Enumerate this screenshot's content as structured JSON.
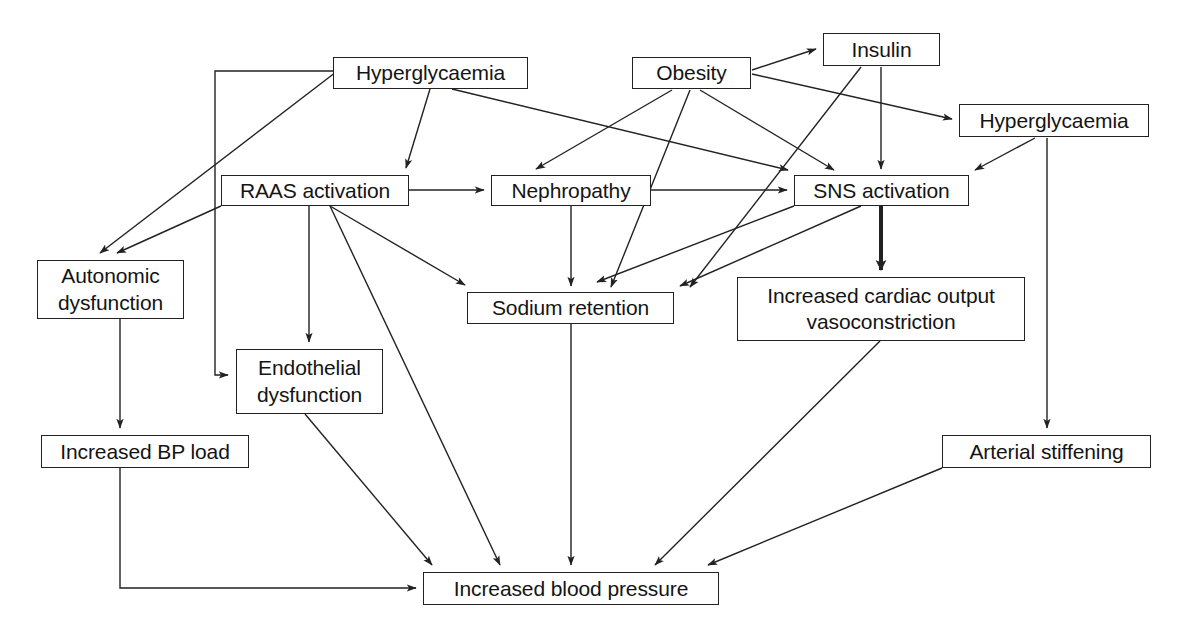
{
  "diagram": {
    "type": "flowchart",
    "canvas": {
      "width": 1188,
      "height": 633
    },
    "style": {
      "box_border_color": "#222222",
      "box_fill_color": "#ffffff",
      "edge_color": "#222222",
      "text_color": "#141414",
      "background": "#ffffff"
    },
    "nodes": [
      {
        "id": "hyperglycaemia_left",
        "label": "Hyperglycaemia",
        "x": 333,
        "y": 57,
        "w": 195,
        "h": 32
      },
      {
        "id": "obesity",
        "label": "Obesity",
        "x": 632,
        "y": 57,
        "w": 119,
        "h": 32
      },
      {
        "id": "insulin",
        "label": "Insulin",
        "x": 823,
        "y": 33,
        "w": 117,
        "h": 33
      },
      {
        "id": "hyperglycaemia_right",
        "label": "Hyperglycaemia",
        "x": 959,
        "y": 104,
        "w": 190,
        "h": 33
      },
      {
        "id": "raas_activation",
        "label": "RAAS activation",
        "x": 221,
        "y": 175,
        "w": 188,
        "h": 31
      },
      {
        "id": "nephropathy",
        "label": "Nephropathy",
        "x": 491,
        "y": 175,
        "w": 160,
        "h": 31
      },
      {
        "id": "sns_activation",
        "label": "SNS activation",
        "x": 794,
        "y": 175,
        "w": 175,
        "h": 31
      },
      {
        "id": "autonomic_dysfunction",
        "label": "Autonomic\ndysfunction",
        "x": 37,
        "y": 260,
        "w": 147,
        "h": 59
      },
      {
        "id": "sodium_retention",
        "label": "Sodium retention",
        "x": 467,
        "y": 292,
        "w": 207,
        "h": 32
      },
      {
        "id": "increased_cardiac_output",
        "label": "Increased cardiac output\nvasoconstriction",
        "x": 737,
        "y": 277,
        "w": 288,
        "h": 64
      },
      {
        "id": "endothelial_dysfunction",
        "label": "Endothelial\ndysfunction",
        "x": 236,
        "y": 349,
        "w": 147,
        "h": 65
      },
      {
        "id": "increased_bp_load",
        "label": "Increased BP load",
        "x": 41,
        "y": 435,
        "w": 208,
        "h": 33
      },
      {
        "id": "arterial_stiffening",
        "label": "Arterial stiffening",
        "x": 942,
        "y": 435,
        "w": 209,
        "h": 33
      },
      {
        "id": "increased_blood_pressure",
        "label": "Increased blood pressure",
        "x": 423,
        "y": 572,
        "w": 296,
        "h": 33
      }
    ],
    "edges": [
      {
        "from": "hyperglycaemia_left",
        "to": "raas_activation",
        "kind": "straight",
        "points": "430,89 406,168",
        "thick": false
      },
      {
        "from": "hyperglycaemia_left",
        "to": "sns_activation",
        "kind": "straight",
        "points": "452,89 788,170",
        "thick": false
      },
      {
        "from": "hyperglycaemia_left",
        "to": "autonomic_dysfunction",
        "kind": "straight",
        "points": "336,72 100,253",
        "thick": false
      },
      {
        "from": "hyperglycaemia_left",
        "to": "endothelial_dysfunction",
        "kind": "elbow",
        "points": "333,71 215,71 215,375 228,375",
        "thick": false
      },
      {
        "from": "obesity",
        "to": "insulin",
        "kind": "straight",
        "points": "752,70 816,49",
        "thick": false
      },
      {
        "from": "obesity",
        "to": "hyperglycaemia_right",
        "kind": "straight",
        "points": "752,74 952,119",
        "thick": false
      },
      {
        "from": "obesity",
        "to": "raas_activation",
        "kind": "straight",
        "points": "672,90 536,169",
        "thick": false
      },
      {
        "from": "obesity",
        "to": "sns_activation",
        "kind": "straight",
        "points": "700,90 834,170",
        "thick": false
      },
      {
        "from": "obesity",
        "to": "sodium_retention",
        "kind": "straight",
        "points": "690,90 611,287",
        "thick": false
      },
      {
        "from": "insulin",
        "to": "sns_activation",
        "kind": "straight",
        "points": "881,67 881,169",
        "thick": false
      },
      {
        "from": "insulin",
        "to": "sodium_retention",
        "kind": "straight",
        "points": "861,67 690,287",
        "thick": false
      },
      {
        "from": "hyperglycaemia_right",
        "to": "sns_activation",
        "kind": "straight",
        "points": "1035,138 975,170",
        "thick": false
      },
      {
        "from": "hyperglycaemia_right",
        "to": "arterial_stiffening",
        "kind": "straight",
        "points": "1047,138 1047,428",
        "thick": false
      },
      {
        "from": "raas_activation",
        "to": "nephropathy",
        "kind": "straight",
        "points": "409,190 484,190",
        "thick": false
      },
      {
        "from": "raas_activation",
        "to": "autonomic_dysfunction",
        "kind": "straight",
        "points": "221,206 117,253",
        "thick": false
      },
      {
        "from": "raas_activation",
        "to": "endothelial_dysfunction",
        "kind": "straight",
        "points": "309,206 309,342",
        "thick": false
      },
      {
        "from": "raas_activation",
        "to": "sodium_retention",
        "kind": "straight",
        "points": "330,206 465,285",
        "thick": false
      },
      {
        "from": "raas_activation",
        "to": "increased_blood_pressure",
        "kind": "straight",
        "points": "330,206 500,565",
        "thick": false
      },
      {
        "from": "nephropathy",
        "to": "sns_activation",
        "kind": "straight",
        "points": "651,190 787,190",
        "thick": false
      },
      {
        "from": "nephropathy",
        "to": "sodium_retention",
        "kind": "straight",
        "points": "571,206 571,286",
        "thick": false
      },
      {
        "from": "sns_activation",
        "to": "sodium_retention",
        "kind": "straight",
        "points": "861,206 680,286",
        "thick": false
      },
      {
        "from": "sns_activation",
        "to": "increased_cardiac_output",
        "kind": "straight",
        "points": "881,206 881,270",
        "thick": true
      },
      {
        "from": "sns_activation",
        "to": "nephropathy_area",
        "kind": "straight",
        "points": "794,206 597,282",
        "thick": false
      },
      {
        "from": "autonomic_dysfunction",
        "to": "increased_bp_load",
        "kind": "straight",
        "points": "120,319 120,428",
        "thick": false
      },
      {
        "from": "increased_bp_load",
        "to": "increased_blood_pressure",
        "kind": "elbow",
        "points": "120,468 120,588 416,588",
        "thick": false
      },
      {
        "from": "endothelial_dysfunction",
        "to": "increased_blood_pressure",
        "kind": "straight",
        "points": "305,414 432,565",
        "thick": false
      },
      {
        "from": "sodium_retention",
        "to": "increased_blood_pressure",
        "kind": "straight",
        "points": "571,324 571,565",
        "thick": false
      },
      {
        "from": "increased_cardiac_output",
        "to": "increased_blood_pressure",
        "kind": "straight",
        "points": "880,341 655,565",
        "thick": false
      },
      {
        "from": "arterial_stiffening",
        "to": "increased_blood_pressure",
        "kind": "straight",
        "points": "942,468 708,565",
        "thick": false
      }
    ]
  }
}
